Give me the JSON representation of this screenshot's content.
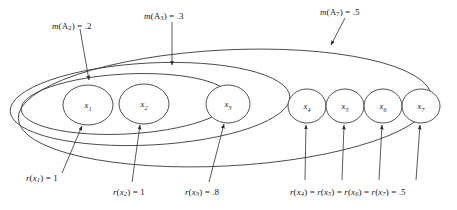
{
  "figure": {
    "type": "nested-set-diagram",
    "background_color": "#ffffff",
    "line_color": "#3c3c3c"
  },
  "sets": [
    {
      "id": "A2",
      "label_html": "<i>m</i>(A<sub class=\"roman-sub\">2</sub>) = .2",
      "mass": ".2",
      "contains": [
        "x1",
        "x2"
      ]
    },
    {
      "id": "A3",
      "label_html": "<i>m</i>(A<sub class=\"roman-sub\">3</sub>) = .3",
      "mass": ".3",
      "contains": [
        "x1",
        "x2",
        "x3"
      ]
    },
    {
      "id": "A7",
      "label_html": "<i>m</i>(A<sub class=\"roman-sub\">7</sub>) = .5",
      "mass": ".5",
      "contains": [
        "x1",
        "x2",
        "x3",
        "x4",
        "x5",
        "x6",
        "x7"
      ]
    }
  ],
  "nodes": [
    {
      "id": "x1",
      "name": "x",
      "index": "1"
    },
    {
      "id": "x2",
      "name": "x",
      "index": "2"
    },
    {
      "id": "x3",
      "name": "x",
      "index": "3"
    },
    {
      "id": "x4",
      "name": "x",
      "index": "4"
    },
    {
      "id": "x5",
      "name": "x",
      "index": "5"
    },
    {
      "id": "x6",
      "name": "x",
      "index": "6"
    },
    {
      "id": "x7",
      "name": "x",
      "index": "7"
    }
  ],
  "node_annotations": [
    {
      "id": "r-x1",
      "label_html": "<i>r</i>(<i>x</i><sub>1</sub>) = 1",
      "value": "1",
      "targets": [
        "x1"
      ]
    },
    {
      "id": "r-x2",
      "label_html": "<i>r</i>(<i>x</i><sub>2</sub>) = 1",
      "value": "1",
      "targets": [
        "x2"
      ]
    },
    {
      "id": "r-x3",
      "label_html": "<i>r</i>(<i>x</i><sub>3</sub>) = .8",
      "value": ".8",
      "targets": [
        "x3"
      ]
    },
    {
      "id": "r-x4567",
      "label_html": "<i>r</i>(<i>x</i><sub>4</sub>) = <i>r</i>(<i>x</i><sub>5</sub>) = <i>r</i>(<i>x</i><sub>6</sub>) = <i>r</i>(<i>x</i><sub>7</sub>) = .5",
      "value": ".5",
      "targets": [
        "x4",
        "x5",
        "x6",
        "x7"
      ]
    }
  ]
}
